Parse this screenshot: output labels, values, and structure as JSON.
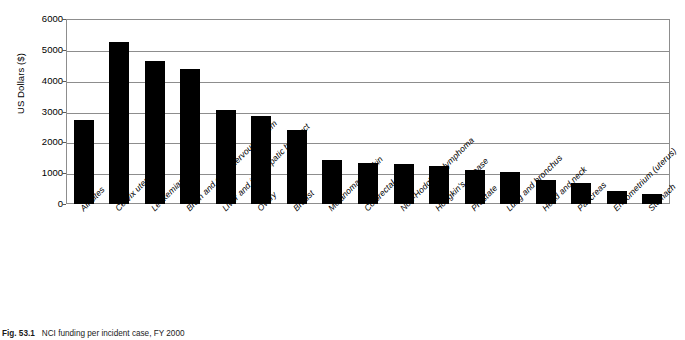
{
  "caption": {
    "figure_number": "Fig. 53.1",
    "text": "NCI funding per incident case, FY 2000"
  },
  "chart_data": {
    "type": "bar",
    "title": "",
    "xlabel": "",
    "ylabel": "US Dollars ($)",
    "ylim": [
      0,
      6000
    ],
    "ytick_step": 1000,
    "yticks": [
      0,
      1000,
      2000,
      3000,
      4000,
      5000,
      6000
    ],
    "ytick_labels": [
      "0",
      "1000",
      "2000",
      "3000",
      "4000",
      "5000",
      "6000"
    ],
    "grid": true,
    "legend": false,
    "bar_color": "#000000",
    "categories": [
      "All sites",
      "Cervix uteri",
      "Leukemias",
      "Brain and other nervous system",
      "Liver and intrahepatic bile duct",
      "Ovary",
      "Breast",
      "Melanomas of skin",
      "Colorectal",
      "Non-Hodgkin's lymphoma",
      "Hodgkin's disease",
      "Prostate",
      "Lung and bronchus",
      "Head and neck",
      "Pancreas",
      "Endometrium (uterus)",
      "Stomach"
    ],
    "values": [
      2710,
      5260,
      4640,
      4380,
      3060,
      2840,
      2390,
      1430,
      1340,
      1300,
      1240,
      1110,
      1040,
      770,
      690,
      420,
      340
    ]
  }
}
